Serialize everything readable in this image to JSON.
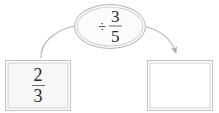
{
  "diagram": {
    "type": "fraction-operation-flow",
    "background_color": "#ffffff",
    "operator_bubble": {
      "icon": "divide-sign",
      "operator_symbol": "÷",
      "operand": {
        "numerator": "3",
        "denominator": "5",
        "text": "3/5"
      },
      "expression": "÷ 3/5",
      "fill_color": "#fbfbfb",
      "border_color": "#b9b9b9"
    },
    "input_box": {
      "label": "input-value",
      "value": {
        "numerator": "2",
        "denominator": "3",
        "text": "2/3"
      },
      "fill_color": "#f7f7f7",
      "border_color": "#c2c2c2"
    },
    "output_box": {
      "label": "answer-value",
      "value": "",
      "placeholder": "",
      "fill_color": "#ffffff",
      "border_color": "#c2c2c2",
      "empty": true
    },
    "connectors": [
      {
        "name": "input-to-operator",
        "from": "input-box",
        "to": "operator-bubble",
        "style": "curve",
        "arrowhead": false,
        "color": "#b3b3b3"
      },
      {
        "name": "operator-to-output",
        "from": "operator-bubble",
        "to": "output-box",
        "style": "curve",
        "arrowhead": true,
        "color": "#b3b3b3"
      }
    ]
  }
}
